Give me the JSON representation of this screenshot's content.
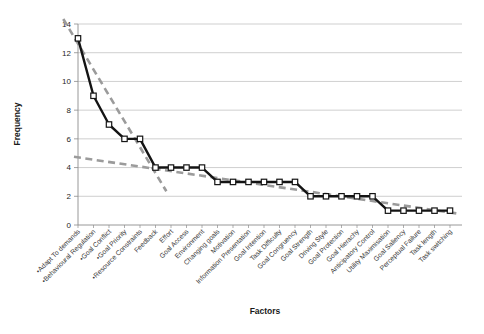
{
  "chart_data": {
    "type": "line",
    "title": "",
    "xlabel": "Factors",
    "ylabel": "Frequency",
    "ylim": [
      0,
      14
    ],
    "yticks": [
      0,
      2,
      4,
      6,
      8,
      10,
      12,
      14
    ],
    "grid": true,
    "legend": "none",
    "marker": "square-white",
    "line_color": "#141414",
    "gridline_color": "#c3c3c3",
    "axis_color": "#8c8c8c",
    "trendline_color": "#9b9b9b",
    "categories": [
      "•Adapt To demands",
      "•Behavioural Regulation",
      "•Goal Conflict",
      "•Goal Priority",
      "•Resource Constraints",
      "Feedback",
      "Effort",
      "Goal Access",
      "Environment",
      "Changing goals",
      "Motivation",
      "Information Presentation",
      "Goal Intention",
      "Task Difficulty",
      "Goal Congruency",
      "Goal Strength",
      "Driving Style",
      "Goal Protection",
      "Goal Hierachy",
      "Anticipatory Control",
      "Utility Maximisation",
      "Goal Saliency",
      "Perceptual Failure",
      "Task length",
      "Task switching"
    ],
    "series": [
      {
        "name": "Frequency",
        "values": [
          13,
          9,
          7,
          6,
          6,
          4,
          4,
          4,
          4,
          3,
          3,
          3,
          3,
          3,
          3,
          2,
          2,
          2,
          2,
          2,
          1,
          1,
          1,
          1,
          1
        ]
      }
    ],
    "trendlines": [
      {
        "name": "steep-trend",
        "style": "dashed",
        "x1": -0.95,
        "y1": 14.35,
        "x2": 5.7,
        "y2": 2.35
      },
      {
        "name": "shallow-trend",
        "style": "dashed",
        "x1": -0.26,
        "y1": 4.75,
        "x2": 24.65,
        "y2": 0.77
      }
    ]
  }
}
